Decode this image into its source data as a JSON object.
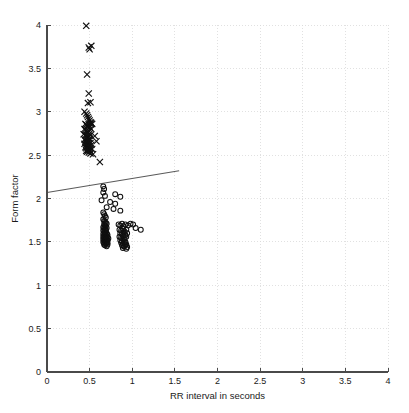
{
  "figure": {
    "background_color": "#ffffff",
    "plot_box": {
      "left": 47,
      "top": 25,
      "right": 388,
      "bottom": 372
    }
  },
  "axes": {
    "x_title": "RR interval in seconds",
    "y_title": "Form factor",
    "x_tick_labels": [
      "0",
      "0.5",
      "1",
      "1.5",
      "2",
      "2.5",
      "3",
      "3.5",
      "4"
    ],
    "y_tick_labels": [
      "0",
      "0.5",
      "1",
      "1.5",
      "2",
      "2.5",
      "3",
      "3.5",
      "4"
    ],
    "axis_color": "#4a4a4a",
    "grid_color": "#d9d9d9"
  },
  "style": {
    "marker_color": "#101010",
    "boundary_color": "#5a5a5a",
    "x_marker_size": 3.1,
    "o_marker_radius": 2.45
  },
  "chart_data": {
    "type": "scatter",
    "title": "",
    "xlabel": "RR interval in seconds",
    "ylabel": "Form factor",
    "xlim": [
      0,
      4
    ],
    "ylim": [
      0,
      4
    ],
    "xticks": [
      0,
      0.5,
      1,
      1.5,
      2,
      2.5,
      3,
      3.5,
      4
    ],
    "yticks": [
      0,
      0.5,
      1,
      1.5,
      2,
      2.5,
      3,
      3.5,
      4
    ],
    "grid": true,
    "grid_style": "dotted",
    "legend": null,
    "legend_position": "none",
    "annotations": [
      {
        "type": "line",
        "label": "linear decision boundary",
        "x": [
          0.0,
          1.55
        ],
        "y": [
          2.07,
          2.32
        ],
        "color": "#5a5a5a"
      }
    ],
    "series": [
      {
        "name": "class-x",
        "marker": "x",
        "color": "#101010",
        "x": [
          0.46,
          0.49,
          0.52,
          0.5,
          0.47,
          0.49,
          0.48,
          0.51,
          0.44,
          0.46,
          0.47,
          0.48,
          0.49,
          0.5,
          0.51,
          0.52,
          0.45,
          0.46,
          0.47,
          0.48,
          0.49,
          0.5,
          0.51,
          0.53,
          0.44,
          0.45,
          0.46,
          0.47,
          0.48,
          0.49,
          0.5,
          0.52,
          0.43,
          0.45,
          0.46,
          0.47,
          0.48,
          0.49,
          0.5,
          0.51,
          0.44,
          0.45,
          0.46,
          0.47,
          0.48,
          0.49,
          0.51,
          0.56,
          0.44,
          0.46,
          0.47,
          0.48,
          0.49,
          0.5,
          0.52,
          0.58,
          0.45,
          0.46,
          0.47,
          0.48,
          0.49,
          0.5,
          0.51,
          0.53,
          0.46,
          0.47,
          0.48,
          0.49,
          0.5,
          0.51,
          0.54,
          0.62
        ],
        "y": [
          3.99,
          3.74,
          3.76,
          3.72,
          3.43,
          3.21,
          3.1,
          3.11,
          3.0,
          2.98,
          2.96,
          2.94,
          2.92,
          2.9,
          2.88,
          2.87,
          2.86,
          2.85,
          2.84,
          2.83,
          2.85,
          2.82,
          2.86,
          2.86,
          2.8,
          2.79,
          2.78,
          2.77,
          2.76,
          2.78,
          2.75,
          2.8,
          2.74,
          2.73,
          2.72,
          2.71,
          2.7,
          2.72,
          2.69,
          2.73,
          2.68,
          2.67,
          2.66,
          2.68,
          2.65,
          2.67,
          2.64,
          2.72,
          2.63,
          2.62,
          2.64,
          2.61,
          2.63,
          2.6,
          2.62,
          2.66,
          2.59,
          2.58,
          2.6,
          2.57,
          2.59,
          2.56,
          2.58,
          2.57,
          2.55,
          2.54,
          2.56,
          2.53,
          2.55,
          2.52,
          2.51,
          2.42
        ]
      },
      {
        "name": "class-o",
        "marker": "o",
        "color": "#101010",
        "x": [
          0.66,
          0.67,
          0.66,
          0.68,
          0.64,
          0.8,
          0.86,
          0.74,
          0.8,
          0.7,
          0.78,
          0.86,
          0.66,
          0.67,
          0.68,
          0.69,
          0.66,
          0.67,
          0.68,
          0.69,
          0.7,
          0.67,
          0.68,
          0.69,
          0.66,
          0.67,
          0.68,
          0.69,
          0.7,
          0.66,
          0.67,
          0.68,
          0.69,
          0.7,
          0.66,
          0.67,
          0.68,
          0.69,
          0.7,
          0.71,
          0.66,
          0.67,
          0.68,
          0.69,
          0.7,
          0.71,
          0.66,
          0.67,
          0.68,
          0.69,
          0.7,
          0.71,
          0.72,
          0.66,
          0.67,
          0.68,
          0.69,
          0.7,
          0.71,
          0.67,
          0.68,
          0.69,
          0.7,
          0.71,
          0.84,
          0.86,
          0.88,
          0.9,
          0.92,
          0.95,
          0.98,
          1.01,
          0.85,
          0.87,
          0.89,
          0.91,
          0.93,
          0.86,
          0.88,
          0.9,
          0.92,
          0.94,
          0.85,
          0.87,
          0.89,
          0.91,
          0.93,
          0.86,
          0.88,
          0.9,
          0.92,
          0.87,
          0.89,
          0.91,
          0.93,
          0.88,
          0.9,
          0.92,
          0.94,
          0.89,
          0.91,
          0.93,
          1.04,
          1.1
        ],
        "y": [
          2.14,
          2.11,
          2.07,
          2.03,
          1.98,
          2.05,
          2.02,
          1.96,
          1.94,
          1.9,
          1.88,
          1.86,
          1.84,
          1.82,
          1.8,
          1.78,
          1.76,
          1.74,
          1.73,
          1.72,
          1.71,
          1.7,
          1.69,
          1.68,
          1.67,
          1.66,
          1.65,
          1.64,
          1.66,
          1.63,
          1.62,
          1.61,
          1.63,
          1.6,
          1.59,
          1.58,
          1.6,
          1.57,
          1.59,
          1.58,
          1.56,
          1.55,
          1.57,
          1.54,
          1.56,
          1.55,
          1.53,
          1.52,
          1.54,
          1.51,
          1.53,
          1.52,
          1.54,
          1.5,
          1.49,
          1.51,
          1.48,
          1.5,
          1.49,
          1.47,
          1.46,
          1.48,
          1.45,
          1.47,
          1.7,
          1.69,
          1.71,
          1.68,
          1.7,
          1.69,
          1.71,
          1.7,
          1.64,
          1.63,
          1.65,
          1.62,
          1.64,
          1.6,
          1.59,
          1.61,
          1.58,
          1.6,
          1.56,
          1.55,
          1.57,
          1.54,
          1.56,
          1.52,
          1.51,
          1.53,
          1.5,
          1.49,
          1.48,
          1.5,
          1.47,
          1.46,
          1.45,
          1.47,
          1.44,
          1.43,
          1.45,
          1.42,
          1.66,
          1.64
        ]
      }
    ]
  }
}
